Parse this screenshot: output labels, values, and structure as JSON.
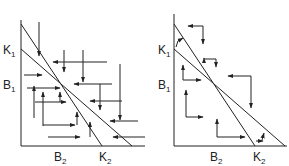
{
  "panels": [
    {
      "id": "left",
      "labels": {
        "k1": "K",
        "k1_sub": "1",
        "b1": "B",
        "b1_sub": "1",
        "b2": "B",
        "b2_sub": "2",
        "k2": "K",
        "k2_sub": "2"
      },
      "description": "Unstable equilibrium: arrows point toward the lines from both sides"
    },
    {
      "id": "right",
      "labels": {
        "k1": "K",
        "k1_sub": "1",
        "b1": "B",
        "b1_sub": "1",
        "b2": "B",
        "b2_sub": "2",
        "k2": "K",
        "k2_sub": "2"
      },
      "description": "Stable equilibrium: arrows circulate around the intersection"
    }
  ],
  "colors": {
    "line": "#222222",
    "background": "#ffffff"
  }
}
